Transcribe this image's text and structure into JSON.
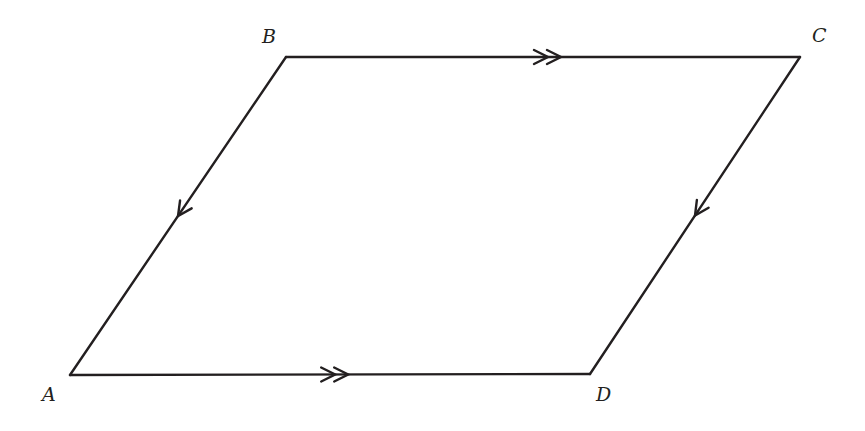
{
  "diagram": {
    "type": "parallelogram",
    "stroke_color": "#231f20",
    "background": "#ffffff",
    "vertices": [
      {
        "label": "A",
        "x": 70,
        "y": 375,
        "label_x": 42,
        "label_y": 401
      },
      {
        "label": "B",
        "x": 286,
        "y": 57,
        "label_x": 262,
        "label_y": 43
      },
      {
        "label": "C",
        "x": 800,
        "y": 57,
        "label_x": 812,
        "label_y": 42
      },
      {
        "label": "D",
        "x": 590,
        "y": 374,
        "label_x": 596,
        "label_y": 401
      }
    ],
    "edges": [
      {
        "from": "B",
        "to": "C",
        "marker": "double-arrow",
        "direction": "B-to-C"
      },
      {
        "from": "A",
        "to": "D",
        "marker": "double-arrow",
        "direction": "A-to-D"
      },
      {
        "from": "B",
        "to": "A",
        "marker": "single-arrow",
        "direction": "B-to-A"
      },
      {
        "from": "C",
        "to": "D",
        "marker": "single-arrow",
        "direction": "C-to-D"
      }
    ]
  }
}
